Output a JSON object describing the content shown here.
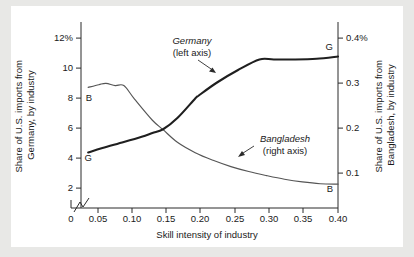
{
  "chart_data": {
    "type": "line",
    "title": "",
    "xlabel": "Skill intensity of industry",
    "ylabel_left": "Share of U.S. imports from Germany, by industry",
    "ylabel_right": "Share of U.S. imports from Bangladesh, by industry",
    "grid": false,
    "legend_position": "inline-annotation",
    "xlim": [
      0.04,
      0.4
    ],
    "x_axis_break": true,
    "x_break_note": "axis break between 0 and 0.05",
    "xticks": [
      "0",
      "0.05",
      "0.10",
      "0.15",
      "0.20",
      "0.25",
      "0.30",
      "0.35",
      "0.40"
    ],
    "xtick_values": [
      0,
      0.05,
      0.1,
      0.15,
      0.2,
      0.25,
      0.3,
      0.35,
      0.4
    ],
    "ylim_left": [
      0.6,
      13.0
    ],
    "yticks_left": [
      "2",
      "4",
      "6",
      "8",
      "10",
      "12%"
    ],
    "ytick_values_left": [
      2,
      4,
      6,
      8,
      10,
      12
    ],
    "ylim_right": [
      0.02,
      0.4333
    ],
    "yticks_right": [
      "0.1",
      "0.2",
      "0.3",
      "0.4%"
    ],
    "ytick_values_right": [
      0.1,
      0.2,
      0.3,
      0.4
    ],
    "series": [
      {
        "name": "Germany",
        "axis": "left",
        "axis_note": "(left axis)",
        "start_marker": "G",
        "end_marker": "G",
        "x": [
          0.05,
          0.07,
          0.1,
          0.125,
          0.14,
          0.155,
          0.175,
          0.2,
          0.205,
          0.23,
          0.26,
          0.29,
          0.31,
          0.34,
          0.37,
          0.4
        ],
        "values": [
          4.3,
          4.6,
          5.0,
          5.35,
          5.6,
          5.85,
          6.6,
          7.9,
          8.1,
          8.95,
          9.8,
          10.5,
          10.5,
          10.5,
          10.55,
          10.7
        ]
      },
      {
        "name": "Bangladesh",
        "axis": "right",
        "axis_note": "(right axis)",
        "start_marker": "B",
        "end_marker": "B",
        "x": [
          0.05,
          0.065,
          0.075,
          0.088,
          0.1,
          0.115,
          0.14,
          0.155,
          0.175,
          0.2,
          0.225,
          0.25,
          0.275,
          0.3,
          0.325,
          0.35,
          0.375,
          0.4
        ],
        "values": [
          0.288,
          0.294,
          0.297,
          0.292,
          0.292,
          0.262,
          0.215,
          0.194,
          0.166,
          0.143,
          0.126,
          0.112,
          0.101,
          0.092,
          0.084,
          0.078,
          0.074,
          0.073
        ]
      }
    ],
    "annotations": [
      {
        "id": "germany-annotation",
        "name": "Germany",
        "sub": "(left axis)",
        "points_to_series": "Germany"
      },
      {
        "id": "bangladesh-annotation",
        "name": "Bangladesh",
        "sub": "(right axis)",
        "points_to_series": "Bangladesh"
      }
    ],
    "colors": {
      "germany_line": "#1f1f1f",
      "bangladesh_line": "#555555",
      "axis": "#2b2b2b",
      "panel_background": "#ffffff",
      "page_background": "#e8e8e6"
    }
  }
}
